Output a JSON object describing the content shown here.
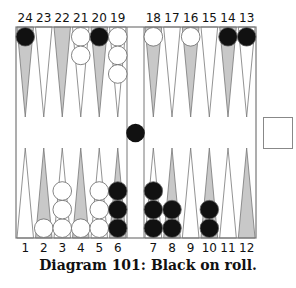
{
  "diagram": {
    "caption": "Diagram 101:  Black on roll.",
    "top_labels": [
      "24",
      "23",
      "22",
      "21",
      "20",
      "19",
      "18",
      "17",
      "16",
      "15",
      "14",
      "13"
    ],
    "bottom_labels": [
      "1",
      "2",
      "3",
      "4",
      "5",
      "6",
      "7",
      "8",
      "9",
      "10",
      "11",
      "12"
    ],
    "colors": {
      "black_checker": "#111111",
      "white_checker": "#ffffff",
      "dark_point": "#c8c8c8",
      "light_point": "#ffffff",
      "line": "#777777"
    },
    "points": [
      {
        "point": 24,
        "checkers": 1,
        "color": "black"
      },
      {
        "point": 21,
        "checkers": 2,
        "color": "white"
      },
      {
        "point": 20,
        "checkers": 1,
        "color": "black"
      },
      {
        "point": 19,
        "checkers": 3,
        "color": "white"
      },
      {
        "point": 18,
        "checkers": 1,
        "color": "white"
      },
      {
        "point": 16,
        "checkers": 1,
        "color": "white"
      },
      {
        "point": 14,
        "checkers": 1,
        "color": "black"
      },
      {
        "point": 13,
        "checkers": 1,
        "color": "black"
      },
      {
        "point": 2,
        "checkers": 1,
        "color": "white"
      },
      {
        "point": 3,
        "checkers": 3,
        "color": "white"
      },
      {
        "point": 4,
        "checkers": 1,
        "color": "white"
      },
      {
        "point": 5,
        "checkers": 3,
        "color": "white"
      },
      {
        "point": 6,
        "checkers": 3,
        "color": "black"
      },
      {
        "point": 7,
        "checkers": 3,
        "color": "black"
      },
      {
        "point": 8,
        "checkers": 2,
        "color": "black"
      },
      {
        "point": 10,
        "checkers": 2,
        "color": "black"
      }
    ],
    "bar": {
      "black": 1,
      "white": 0
    },
    "cube": {
      "value": ""
    }
  }
}
